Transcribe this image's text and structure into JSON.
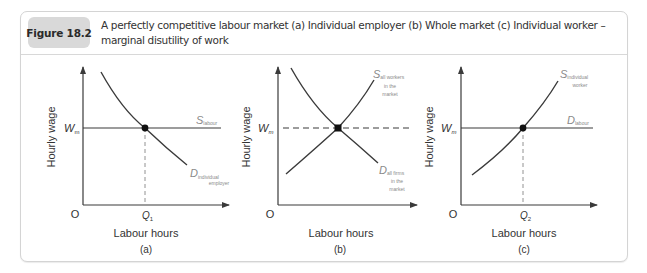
{
  "figure": {
    "badge": "Figure 18.2",
    "caption_line1": "A perfectly competitive labour market (a) Individual employer (b) Whole market (c) Individual worker –",
    "caption_line2": "marginal disutility of work"
  },
  "panels": [
    {
      "id": "a",
      "panel_label": "(a)",
      "y_axis_label": "Hourly wage",
      "x_axis_label": "Labour hours",
      "origin": "O",
      "wage_label": "W",
      "wage_sub": "m",
      "q_label": "Q",
      "q_sub": "1",
      "curve1_main": "S",
      "curve1_sub": "labour",
      "curve2_main": "D",
      "curve2_sub1": "individual",
      "curve2_sub2": "employer"
    },
    {
      "id": "b",
      "panel_label": "(b)",
      "y_axis_label": "Hourly wage",
      "x_axis_label": "Labour hours",
      "origin": "O",
      "wage_label": "W",
      "wage_sub": "m",
      "curve1_main": "S",
      "curve1_sub1": "all workers",
      "curve1_sub2": "in the",
      "curve1_sub3": "market",
      "curve2_main": "D",
      "curve2_sub1": "all firms",
      "curve2_sub2": "in the",
      "curve2_sub3": "market"
    },
    {
      "id": "c",
      "panel_label": "(c)",
      "y_axis_label": "Hourly wage",
      "x_axis_label": "Labour hours",
      "origin": "O",
      "wage_label": "W",
      "wage_sub": "m",
      "q_label": "Q",
      "q_sub": "2",
      "curve1_main": "S",
      "curve1_sub1": "individual",
      "curve1_sub2": "worker",
      "curve2_main": "D",
      "curve2_sub": "labour"
    }
  ],
  "colors": {
    "line": "#3a3a3a",
    "badge_bg": "#d9d9d9",
    "border": "#d4d4d4",
    "subscript": "#8a8a8a"
  }
}
